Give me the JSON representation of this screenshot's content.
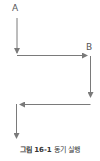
{
  "diagram": {
    "labels": {
      "a": "A",
      "b": "B"
    },
    "colors": {
      "line": "#7a7a7a",
      "text": "#555555"
    }
  },
  "caption": {
    "number": "그림 16-1",
    "title": "동기 실행"
  }
}
